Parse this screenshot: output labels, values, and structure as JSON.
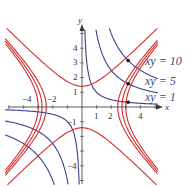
{
  "chart_data": {
    "type": "line",
    "title": "",
    "xlabel": "x",
    "ylabel": "y",
    "xlim": [
      -5.5,
      5.5
    ],
    "ylim": [
      -5.5,
      5.5
    ],
    "grid": false,
    "x_ticks": [
      "-4",
      "-2",
      "1",
      "2",
      "4"
    ],
    "y_ticks": [
      "4",
      "3",
      "2",
      "1",
      "-1",
      "-4"
    ],
    "series": [
      {
        "name": "xy = 10",
        "color": "#3b3f8f",
        "equation": "xy=10"
      },
      {
        "name": "xy = 5",
        "color": "#3b3f8f",
        "equation": "xy=5"
      },
      {
        "name": "xy = 1",
        "color": "#3b3f8f",
        "equation": "xy=1"
      },
      {
        "name": "y^2 - x^2 = 2",
        "color": "#d42a2a",
        "equation": "y^2-x^2=2"
      },
      {
        "name": "x^2 - y^2 = 6",
        "color": "#d42a2a",
        "equation": "x^2-y^2=6"
      },
      {
        "name": "x^2 - y^2 = 7.5",
        "color": "#d42a2a",
        "equation": "x^2-y^2=7.5"
      },
      {
        "name": "x^2 - y^2 = 9",
        "color": "#d42a2a",
        "equation": "x^2-y^2=9"
      }
    ],
    "points": [
      [
        3.16,
        3.16
      ],
      [
        3.16,
        1.58
      ],
      [
        3.16,
        0.32
      ]
    ],
    "annotations": [
      "xy = 10",
      "xy = 5",
      "xy = 1"
    ]
  },
  "labels": {
    "x_axis": "x",
    "y_axis": "y",
    "curve1": "xy = 10",
    "curve2": "xy = 5",
    "curve3": "xy = 1",
    "tick_xm4": "−4",
    "tick_xm2": "−2",
    "tick_x1": "1",
    "tick_x2": "2",
    "tick_x4": "4",
    "tick_y4": "4",
    "tick_y3": "3",
    "tick_y2": "2",
    "tick_y1": "1",
    "tick_ym1": "−1",
    "tick_ym4": "−4"
  }
}
